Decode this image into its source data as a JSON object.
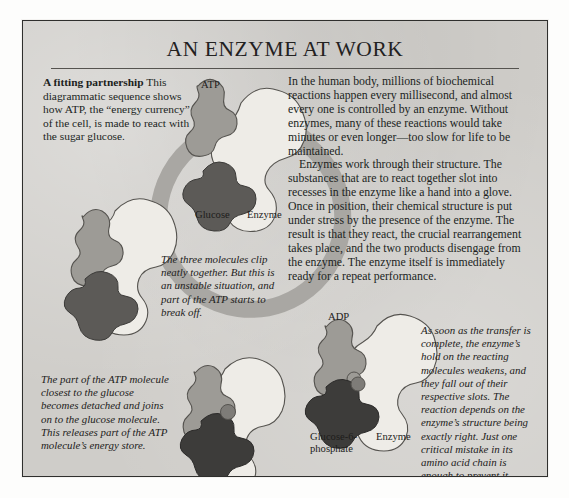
{
  "page": {
    "title": "AN ENZYME AT WORK"
  },
  "sidebar": {
    "heading": "A fitting partnership",
    "body": "This diagrammatic sequence shows how ATP, the “energy currency” of the cell, is made to react with the sugar glucose."
  },
  "main": {
    "paragraphs": [
      "In the human body, millions of biochemical reactions happen every millisecond, and almost every one is controlled by an enzyme. Without enzymes, many of these reactions would take minutes or even longer—too slow for life to be maintained.",
      "Enzymes work through their structure. The substances that are to react together slot into recesses in the enzyme like a hand into a glove. Once in position, their chemical structure is put under stress by the presence of the enzyme. The result is that they react, the crucial rearrangement takes place, and the two products disengage from the enzyme. The enzyme itself is immediately ready for a repeat performance."
    ]
  },
  "captions": {
    "middle": "The three molecules clip neatly together. But this is an unstable situation, and part of the ATP starts to break off.",
    "lower_left": "The part of the ATP molecule closest to the glucose becomes detached and joins on to the glucose molecule. This releases part of the ATP molecule’s energy store.",
    "lower_right": "As soon as the transfer is complete, the enzyme’s hold on the reacting molecules weakens, and they fall out of their respective slots. The reaction depends on the enzyme’s structure being exactly right. Just one critical mistake in its amino acid chain is enough to prevent it working."
  },
  "diagram": {
    "labels": {
      "atp": "ATP",
      "glucose": "Glucose",
      "enzyme_top": "Enzyme",
      "adp": "ADP",
      "glucose_6_phosphate": "Glucose-6-\nphosphate",
      "enzyme_bottom": "Enzyme"
    },
    "colors": {
      "paper": "#cfcdc9",
      "border": "#2f2f2d",
      "cycle_arrow": "#a9a7a3",
      "enzyme_fill": "#eeece7",
      "atp_fill": "#9d9b96",
      "glucose_fill": "#5c5a57",
      "outline": "#55534f",
      "text": "#201f1d"
    },
    "stages": [
      {
        "name": "stage-top",
        "molecules": [
          "ATP",
          "Glucose",
          "Enzyme"
        ]
      },
      {
        "name": "stage-left",
        "molecules": [
          "ATP",
          "Glucose",
          "Enzyme"
        ]
      },
      {
        "name": "stage-bottom",
        "molecules": [
          "ATP",
          "Glucose",
          "Enzyme"
        ]
      },
      {
        "name": "stage-right",
        "molecules": [
          "ADP",
          "Glucose-6-phosphate",
          "Enzyme"
        ]
      }
    ]
  }
}
